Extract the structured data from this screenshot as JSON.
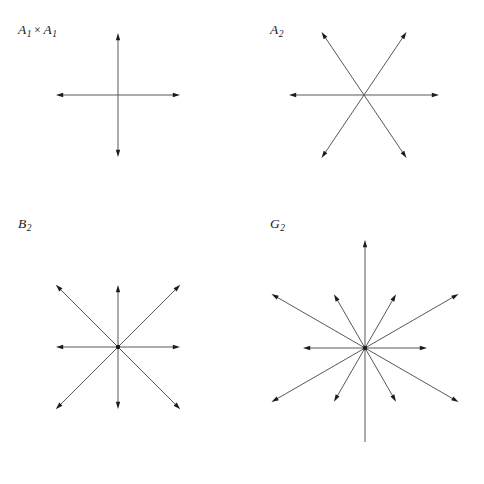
{
  "figure": {
    "background_color": "#ffffff",
    "line_color": "#585858",
    "arrow_color": "#1c1c1c",
    "width": 484,
    "height": 484
  },
  "panels": [
    {
      "id": "a1xa1",
      "label": "A₁ × A₁",
      "label_base": "A",
      "label_sub": "1",
      "label_sep": "×",
      "label_base2": "A",
      "label_sub2": "1",
      "label_x": 18,
      "label_y": 22,
      "panel_x": 0,
      "panel_y": 0,
      "center_x": 118,
      "center_y": 95,
      "origin_dot": false,
      "roots": [
        {
          "angle_deg": 0,
          "length": 62,
          "type": "long"
        },
        {
          "angle_deg": 90,
          "length": 62,
          "type": "long"
        },
        {
          "angle_deg": 180,
          "length": 62,
          "type": "long"
        },
        {
          "angle_deg": 270,
          "length": 62,
          "type": "long"
        }
      ],
      "root_count": 4
    },
    {
      "id": "a2",
      "label": "A₂",
      "label_base": "A",
      "label_sub": "2",
      "label_x": 270,
      "label_y": 22,
      "panel_x": 242,
      "panel_y": 0,
      "center_x": 364,
      "center_y": 95,
      "origin_dot": false,
      "roots": [
        {
          "angle_deg": 0,
          "length": 75,
          "type": "long"
        },
        {
          "angle_deg": 56,
          "length": 76,
          "type": "long"
        },
        {
          "angle_deg": 124,
          "length": 76,
          "type": "long"
        },
        {
          "angle_deg": 180,
          "length": 75,
          "type": "long"
        },
        {
          "angle_deg": 236,
          "length": 76,
          "type": "long"
        },
        {
          "angle_deg": 304,
          "length": 76,
          "type": "long"
        }
      ],
      "root_count": 6
    },
    {
      "id": "b2",
      "label": "B₂",
      "label_base": "B",
      "label_sub": "2",
      "label_x": 18,
      "label_y": 216,
      "panel_x": 0,
      "panel_y": 200,
      "center_x": 118,
      "center_y": 347,
      "origin_dot": true,
      "roots": [
        {
          "angle_deg": 0,
          "length": 62,
          "type": "short"
        },
        {
          "angle_deg": 45,
          "length": 88,
          "type": "long"
        },
        {
          "angle_deg": 90,
          "length": 62,
          "type": "short"
        },
        {
          "angle_deg": 135,
          "length": 88,
          "type": "long"
        },
        {
          "angle_deg": 180,
          "length": 62,
          "type": "short"
        },
        {
          "angle_deg": 225,
          "length": 88,
          "type": "long"
        },
        {
          "angle_deg": 270,
          "length": 62,
          "type": "short"
        },
        {
          "angle_deg": 315,
          "length": 88,
          "type": "long"
        }
      ],
      "root_count": 8
    },
    {
      "id": "g2",
      "label": "G₂",
      "label_base": "G",
      "label_sub": "2",
      "label_x": 270,
      "label_y": 216,
      "panel_x": 242,
      "panel_y": 200,
      "center_x": 365,
      "center_y": 348,
      "origin_dot": true,
      "roots": [
        {
          "angle_deg": 0,
          "length": 62,
          "type": "short"
        },
        {
          "angle_deg": 30,
          "length": 108,
          "type": "long"
        },
        {
          "angle_deg": 60,
          "length": 62,
          "type": "short"
        },
        {
          "angle_deg": 90,
          "length": 108,
          "type": "long"
        },
        {
          "angle_deg": 120,
          "length": 62,
          "type": "short"
        },
        {
          "angle_deg": 150,
          "length": 108,
          "type": "long"
        },
        {
          "angle_deg": 180,
          "length": 62,
          "type": "short"
        },
        {
          "angle_deg": 210,
          "length": 108,
          "type": "long"
        },
        {
          "angle_deg": 240,
          "length": 62,
          "type": "short"
        },
        {
          "angle_deg": 270,
          "length": 108,
          "type": "long"
        },
        {
          "angle_deg": 300,
          "length": 62,
          "type": "short"
        },
        {
          "angle_deg": 330,
          "length": 108,
          "type": "long"
        }
      ],
      "root_count": 12
    }
  ]
}
